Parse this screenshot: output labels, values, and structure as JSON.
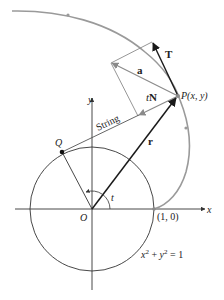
{
  "diagram": {
    "labels": {
      "T": "T",
      "a": "a",
      "P": "P(x, y)",
      "tN": "tN",
      "tN_t": "t",
      "tN_N": "N",
      "string": "String",
      "Q": "Q",
      "r": "r",
      "y_axis": "y",
      "x_axis": "x",
      "origin": "O",
      "angle": "t",
      "point_10": "(1, 0)",
      "equation": "x² + y² = 1"
    },
    "colors": {
      "curve": "#9a9a9a",
      "vectors": "#1a1a1a",
      "parallelogram": "#8a8a8a",
      "axes": "#333333"
    }
  }
}
